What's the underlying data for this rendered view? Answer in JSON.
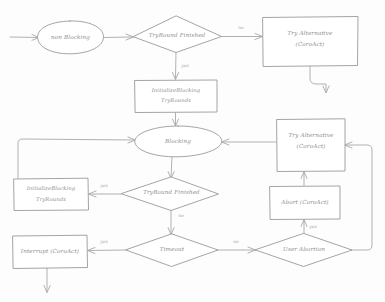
{
  "diagram": {
    "style": "hand-drawn",
    "colors": {
      "background": "#fdfdfd",
      "stroke": "#9a9a9a",
      "edge": "#a8a8a8",
      "text": "#8d8d8d",
      "label": "#a5a5a5"
    },
    "nodes": [
      {
        "id": "non-blocking",
        "shape": "ellipse",
        "label": "non Blocking"
      },
      {
        "id": "tryround-finished-top",
        "shape": "diamond",
        "label": "TryRound Finished"
      },
      {
        "id": "try-alternative-top",
        "shape": "rectangle",
        "label_line1": "Try Alternative",
        "label_line2": "(CoroAct)"
      },
      {
        "id": "init-blocking-top",
        "shape": "rectangle",
        "label_line1": "InitializeBlocking",
        "label_line2": "TryRounds"
      },
      {
        "id": "blocking",
        "shape": "ellipse",
        "label": "Blocking"
      },
      {
        "id": "try-alternative-right",
        "shape": "rectangle",
        "label_line1": "Try Alternative",
        "label_line2": "(CoroAct)"
      },
      {
        "id": "init-blocking-left",
        "shape": "rectangle",
        "label_line1": "InitializeBlocking",
        "label_line2": "TryRounds"
      },
      {
        "id": "tryround-finished-mid",
        "shape": "diamond",
        "label": "TryRound Finished"
      },
      {
        "id": "abort",
        "shape": "rectangle",
        "label": "Abort (CoroAct)"
      },
      {
        "id": "interrupt",
        "shape": "rectangle",
        "label": "Interrupt (CoroAct)"
      },
      {
        "id": "timeout",
        "shape": "diamond",
        "label": "Timeout"
      },
      {
        "id": "user-abortion",
        "shape": "diamond",
        "label": "User Abortion"
      }
    ],
    "edge_labels": {
      "top_no": "no",
      "top_yes": "yes",
      "mid_yes": "yes",
      "mid_no": "no",
      "timeout_yes": "yes",
      "timeout_no": "no",
      "user_abortion_yes": "yes"
    }
  }
}
